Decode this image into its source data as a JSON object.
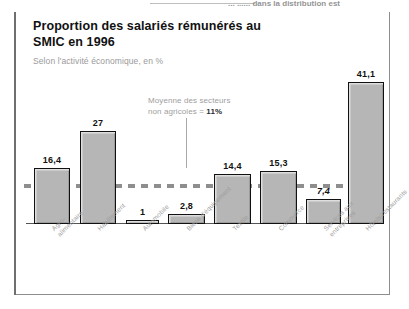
{
  "scan_artifact": {
    "text_fragment": "... ...... dans la distribution est"
  },
  "header": {
    "title": "Proportion des salariés rémunérés au SMIC en 1996",
    "subtitle": "Selon l'activité économique, en %"
  },
  "annotation": {
    "line1": "Moyenne des secteurs",
    "line2_prefix": "non agricoles = ",
    "value": "11%"
  },
  "chart_data": {
    "type": "bar",
    "title": "Proportion des salariés rémunérés au SMIC en 1996",
    "subtitle": "Selon l'activité économique, en %",
    "xlabel": "",
    "ylabel": "",
    "unit": "%",
    "ylim": [
      0,
      45
    ],
    "grid": false,
    "legend": false,
    "categories": [
      "Agro-\nalimentaire",
      "Habillement",
      "Automobile",
      "Biens d'équipement",
      "Textile",
      "Commerce",
      "Services aux entreprises",
      "Hôtels/restaurants"
    ],
    "values": [
      16.4,
      27,
      1,
      2.8,
      14.4,
      15.3,
      7.4,
      41.1
    ],
    "value_labels": [
      "16,4",
      "27",
      "1",
      "2,8",
      "14,4",
      "15,3",
      "7,4",
      "41,1"
    ],
    "reference_line": {
      "label": "Moyenne des secteurs non agricoles",
      "value": 11,
      "value_label": "11%",
      "style": "dashed",
      "color": "#8e8e8e"
    },
    "colors": {
      "bar_fill": "#b6b6b6",
      "bar_border": "#111111",
      "label_text": "#9d9d9d",
      "value_text": "#111111"
    }
  }
}
